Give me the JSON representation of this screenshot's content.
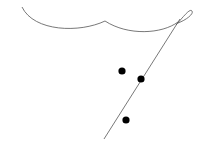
{
  "diagram": {
    "width": 205,
    "height": 149,
    "background": "#ffffff",
    "stroke_color": "#555555",
    "dot_color": "#000000",
    "curves": [
      {
        "name": "left-arc",
        "d": "M22,7 C34,32 80,33 105,21"
      },
      {
        "name": "right-arc",
        "d": "M105,21 C128,36 162,34 178,22"
      },
      {
        "name": "diagonal-line",
        "d": "M104,139 L180,19"
      },
      {
        "name": "loop",
        "d": "M176,25 C184,16 190,8 192,11 C194,14 186,20 178,23"
      }
    ],
    "points": [
      {
        "name": "dot-1",
        "cx": 122,
        "cy": 71,
        "r": 3.6
      },
      {
        "name": "dot-2",
        "cx": 141,
        "cy": 79,
        "r": 3.6
      },
      {
        "name": "dot-3",
        "cx": 126,
        "cy": 120,
        "r": 3.6
      }
    ]
  }
}
